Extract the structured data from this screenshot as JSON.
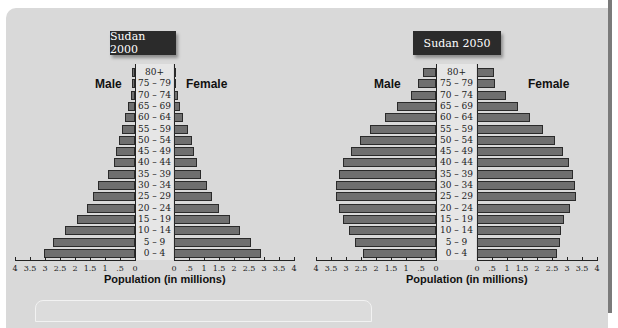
{
  "chart_data": [
    {
      "type": "bar",
      "orientation": "horizontal-population-pyramid",
      "title": "Sudan 2000",
      "xlabel": "Population (in millions)",
      "ylabel": "",
      "xlim": [
        0,
        4
      ],
      "x_ticks": [
        "4",
        "3.5",
        "3",
        "2.5",
        "2",
        "1.5",
        "1",
        ".5",
        "0",
        "0",
        ".5",
        "1",
        "1.5",
        "2",
        "2.5",
        "3",
        "3.5",
        "4"
      ],
      "categories": [
        "80+",
        "75 – 79",
        "70 – 74",
        "65 – 69",
        "60 – 64",
        "55 – 59",
        "50 – 54",
        "45 – 49",
        "40 – 44",
        "35 – 39",
        "30 – 34",
        "25 – 29",
        "20 – 24",
        "15 – 19",
        "10 – 14",
        "5 – 9",
        "0 – 4"
      ],
      "series": [
        {
          "name": "Male",
          "values": [
            0.1,
            0.1,
            0.15,
            0.25,
            0.35,
            0.45,
            0.55,
            0.65,
            0.7,
            0.9,
            1.25,
            1.4,
            1.6,
            1.95,
            2.35,
            2.75,
            3.05
          ]
        },
        {
          "name": "Female",
          "values": [
            0.05,
            0.07,
            0.12,
            0.2,
            0.3,
            0.45,
            0.6,
            0.65,
            0.75,
            0.9,
            1.1,
            1.25,
            1.5,
            1.85,
            2.2,
            2.55,
            2.9
          ]
        }
      ],
      "grid": false
    },
    {
      "type": "bar",
      "orientation": "horizontal-population-pyramid",
      "title": "Sudan 2050",
      "xlabel": "Population (in millions)",
      "ylabel": "",
      "xlim": [
        0,
        4
      ],
      "x_ticks": [
        "4",
        "3.5",
        "3",
        "2.5",
        "2",
        "1.5",
        "1",
        ".5",
        "0",
        "0",
        ".5",
        "1",
        "1.5",
        "2",
        "2.5",
        "3",
        "3.5",
        "4"
      ],
      "categories": [
        "80+",
        "75 – 79",
        "70 – 74",
        "65 – 69",
        "60 – 64",
        "55 – 59",
        "50 – 54",
        "45 – 49",
        "40 – 44",
        "35 – 39",
        "30 – 34",
        "25 – 29",
        "20 – 24",
        "15 – 19",
        "10 – 14",
        "5 – 9",
        "0 – 4"
      ],
      "series": [
        {
          "name": "Male",
          "values": [
            0.45,
            0.6,
            0.85,
            1.3,
            1.7,
            2.2,
            2.55,
            2.85,
            3.1,
            3.25,
            3.35,
            3.35,
            3.25,
            3.1,
            2.9,
            2.7,
            2.45
          ]
        },
        {
          "name": "Female",
          "values": [
            0.55,
            0.6,
            0.95,
            1.35,
            1.75,
            2.2,
            2.6,
            2.85,
            3.05,
            3.2,
            3.25,
            3.3,
            3.1,
            2.9,
            2.8,
            2.75,
            2.65
          ]
        }
      ],
      "grid": false
    }
  ],
  "labels": {
    "male": "Male",
    "female": "Female",
    "xlabel": "Population (in millions)"
  },
  "colors": {
    "bar_fill": "#6f6f6f",
    "bar_border": "#2a2a2a",
    "panel_bg": "#d9d9d9",
    "title_bg": "#2b2b2b"
  }
}
